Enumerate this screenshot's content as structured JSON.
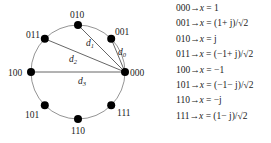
{
  "diagram": {
    "circle": {
      "cx": 78,
      "cy": 72,
      "r": 47,
      "stroke": "#888888"
    },
    "points": [
      {
        "label": "000",
        "angle_deg": 0
      },
      {
        "label": "001",
        "angle_deg": 45
      },
      {
        "label": "010",
        "angle_deg": 90
      },
      {
        "label": "011",
        "angle_deg": 135
      },
      {
        "label": "100",
        "angle_deg": 180
      },
      {
        "label": "101",
        "angle_deg": 225
      },
      {
        "label": "110",
        "angle_deg": 270
      },
      {
        "label": "111",
        "angle_deg": 315
      }
    ],
    "distances": [
      {
        "label": "d",
        "sub": "0",
        "from": "000",
        "to": "001"
      },
      {
        "label": "d",
        "sub": "1",
        "from": "000",
        "to": "010"
      },
      {
        "label": "d",
        "sub": "2",
        "from": "000",
        "to": "011"
      },
      {
        "label": "d",
        "sub": "3",
        "from": "000",
        "to": "100"
      }
    ],
    "point_color": "#000000",
    "line_color": "#555555"
  },
  "mapping": [
    {
      "bits": "000",
      "arrow": "→",
      "lhs": "x",
      "rhs": " = 1"
    },
    {
      "bits": "001",
      "arrow": "→",
      "lhs": "x",
      "rhs": " = (1+ j)/√2"
    },
    {
      "bits": "010",
      "arrow": "→",
      "lhs": "x",
      "rhs": " = j"
    },
    {
      "bits": "011",
      "arrow": "→",
      "lhs": "x",
      "rhs": " = (−1+ j)/√2"
    },
    {
      "bits": "100",
      "arrow": "→",
      "lhs": "x",
      "rhs": " = −1"
    },
    {
      "bits": "101",
      "arrow": "→",
      "lhs": "x",
      "rhs": " = (−1− j)/√2"
    },
    {
      "bits": "110",
      "arrow": "→",
      "lhs": "x",
      "rhs": " = −j"
    },
    {
      "bits": "111",
      "arrow": "→",
      "lhs": "x",
      "rhs": " = (1− j)/√2"
    }
  ]
}
